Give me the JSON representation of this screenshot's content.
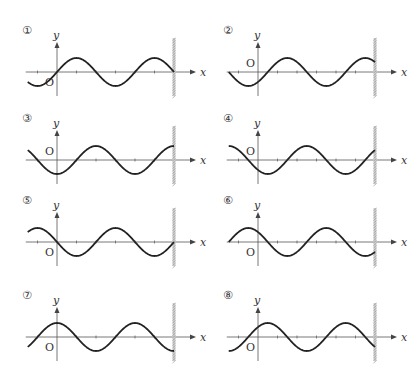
{
  "diagram": {
    "axis_labels": {
      "x": "x",
      "y": "y",
      "origin": "O"
    },
    "units": {
      "wavelength": 4,
      "x_min": -1.5,
      "wall_x": 6
    },
    "panels": [
      {
        "id": 1,
        "label": "①",
        "formula": "sin",
        "phase_shift": 0
      },
      {
        "id": 2,
        "label": "②",
        "formula": "sin",
        "phase_shift": 0.5
      },
      {
        "id": 3,
        "label": "③",
        "formula": "-cos",
        "phase_shift": 0
      },
      {
        "id": 4,
        "label": "④",
        "formula": "-cos",
        "phase_shift": 0.5
      },
      {
        "id": 5,
        "label": "⑤",
        "formula": "-sin",
        "phase_shift": 0
      },
      {
        "id": 6,
        "label": "⑥",
        "formula": "-sin",
        "phase_shift": 0.5
      },
      {
        "id": 7,
        "label": "⑦",
        "formula": "cos",
        "phase_shift": 0
      },
      {
        "id": 8,
        "label": "⑧",
        "formula": "cos",
        "phase_shift": 0.5
      }
    ]
  }
}
